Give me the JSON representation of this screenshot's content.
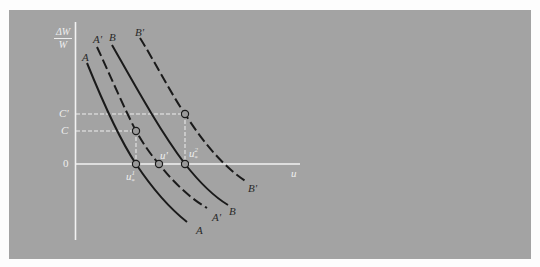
{
  "diagram": {
    "type": "phillips-curve-shift",
    "y_axis_label_numerator": "ΔW",
    "y_axis_label_denominator": "W",
    "x_axis_label": "u",
    "y_ticks": [
      {
        "label": "C'",
        "y": 114
      },
      {
        "label": "C",
        "y": 131
      },
      {
        "label": "0",
        "y": 164
      }
    ],
    "curves": [
      {
        "name": "A",
        "style": "solid",
        "top_label": "A",
        "bottom_label": "A"
      },
      {
        "name": "A'",
        "style": "dashed",
        "top_label": "A'",
        "bottom_label": "A'"
      },
      {
        "name": "B",
        "style": "solid",
        "top_label": "B",
        "bottom_label": "B"
      },
      {
        "name": "B'",
        "style": "dashed",
        "top_label": "B'",
        "bottom_label": "B'"
      }
    ],
    "point_labels": {
      "u_star_1": "u",
      "u_star_1_sup": "1",
      "u_star_1_sub": "*",
      "u_prime": "u'",
      "u_star_2": "u",
      "u_star_2_sup": "2",
      "u_star_2_sub": "*"
    },
    "colors": {
      "background": "#a3a3a3",
      "axis": "#f0f0f0",
      "curve": "#1a1a1a",
      "guide": "#eeeeee"
    }
  }
}
